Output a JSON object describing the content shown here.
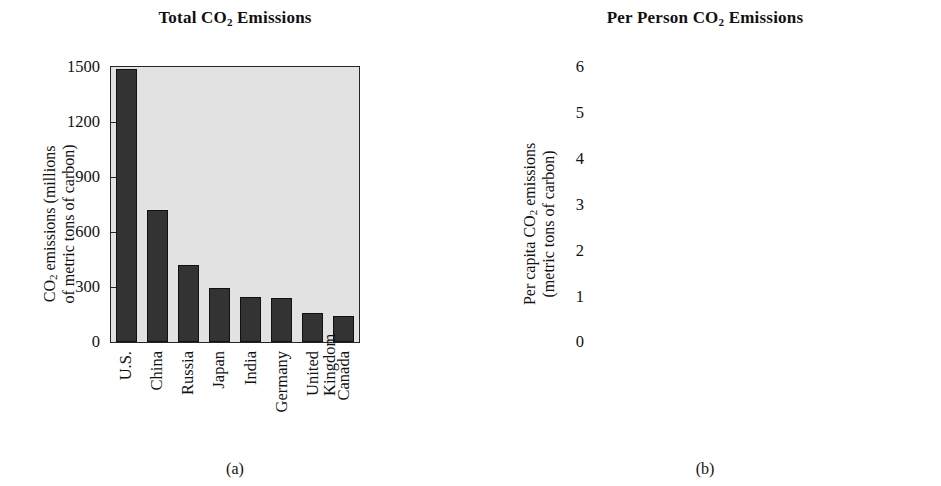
{
  "figure": {
    "background": "#ffffff",
    "bar_color": "#333333",
    "plot_background": "#e2e2e2",
    "axis_color": "#262626"
  },
  "panels": [
    {
      "caption": "(a)",
      "title_parts": {
        "pre": "Total CO",
        "sub": "2",
        "post": " Emissions"
      },
      "ytitle_line1_pre": "CO",
      "ytitle_line1_sub": "2",
      "ytitle_line1_post": " emissions (millions",
      "ytitle_line2": "of metric tons of carbon)",
      "yticks": [
        "1500",
        "1200",
        "900",
        "600",
        "300",
        "0"
      ]
    },
    {
      "caption": "(b)",
      "title_parts": {
        "pre": "Per Person CO",
        "sub": "2",
        "post": " Emissions"
      },
      "ytitle_line1_pre": "Per capita CO",
      "ytitle_line1_sub": "2",
      "ytitle_line1_post": " emissions",
      "ytitle_line2": "(metric tons of carbon)",
      "yticks": [
        "6",
        "5",
        "4",
        "3",
        "2",
        "1",
        "0"
      ]
    }
  ],
  "chart_data": [
    {
      "type": "bar",
      "title": "Total CO2 Emissions",
      "caption": "(a)",
      "xlabel": "",
      "ylabel": "CO2 emissions (millions of metric tons of carbon)",
      "ylim": [
        0,
        1500
      ],
      "yticks": [
        0,
        300,
        600,
        900,
        1200,
        1500
      ],
      "grid": false,
      "legend": "none",
      "categories": [
        "U.S.",
        "China",
        "Russia",
        "Japan",
        "India",
        "Germany",
        "United Kingdom",
        "Canada"
      ],
      "category_lines": [
        [
          "U.S."
        ],
        [
          "China"
        ],
        [
          "Russia"
        ],
        [
          "Japan"
        ],
        [
          "India"
        ],
        [
          "Germany"
        ],
        [
          "United",
          "Kingdom"
        ],
        [
          "Canada"
        ]
      ],
      "values": [
        1490,
        720,
        420,
        295,
        245,
        240,
        160,
        140
      ]
    },
    {
      "type": "bar",
      "title": "Per Person CO2 Emissions",
      "caption": "(b)",
      "xlabel": "",
      "ylabel": "Per capita CO2 emissions (metric tons of carbon)",
      "ylim": [
        0,
        6
      ],
      "yticks": [
        0,
        1,
        2,
        3,
        4,
        5,
        6
      ],
      "grid": false,
      "legend": "none",
      "categories": [
        "U.S.",
        "Canada",
        "Russia",
        "Germany",
        "United Kingdom",
        "Japan",
        "China",
        "India"
      ],
      "category_lines": [
        [
          "U.S."
        ],
        [
          "Canada"
        ],
        [
          "Russia"
        ],
        [
          "Germany"
        ],
        [
          "United",
          "Kingdom"
        ],
        [
          "Japan"
        ],
        [
          "China"
        ],
        [
          "India"
        ]
      ],
      "values": [
        5.5,
        4.6,
        2.8,
        2.8,
        2.5,
        2.25,
        0.6,
        0.3
      ]
    }
  ]
}
